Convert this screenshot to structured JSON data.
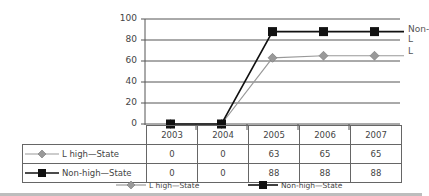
{
  "chart_data": {
    "type": "line",
    "title": "",
    "xlabel": "",
    "ylabel": "",
    "categories": [
      "2003",
      "2004",
      "2005",
      "2006",
      "2007"
    ],
    "series": [
      {
        "name": "L high—State",
        "end_label": "L",
        "marker": "diamond",
        "color": "#999999",
        "values": [
          0,
          0,
          63,
          65,
          65
        ]
      },
      {
        "name": "Non-high—State",
        "end_label": "Non-L",
        "marker": "square",
        "color": "#111111",
        "values": [
          0,
          0,
          88,
          88,
          88
        ]
      }
    ],
    "yticks": [
      "100",
      "80",
      "60",
      "40",
      "20",
      "0"
    ],
    "ylim": [
      0,
      100
    ],
    "grid": true,
    "legend_position": "bottom",
    "data_table": true
  },
  "yaxis": {
    "ticks": [
      "100",
      "80",
      "60",
      "40",
      "20",
      "0"
    ]
  },
  "table": {
    "years": [
      "2003",
      "2004",
      "2005",
      "2006",
      "2007"
    ],
    "rows": [
      {
        "label": "L high—State",
        "values": [
          "0",
          "0",
          "63",
          "65",
          "65"
        ]
      },
      {
        "label": "Non-high—State",
        "values": [
          "0",
          "0",
          "88",
          "88",
          "88"
        ]
      }
    ]
  },
  "end_labels": {
    "l": "L",
    "non_l": "Non-L"
  },
  "legend": {
    "items": [
      {
        "label": "L high—State"
      },
      {
        "label": "Non-high—State"
      }
    ]
  }
}
